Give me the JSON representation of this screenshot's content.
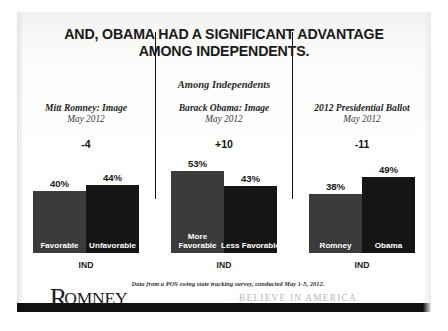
{
  "slide": {
    "title_line1": "AND, OBAMA HAD A SIGNIFICANT ADVANTAGE",
    "title_line2": "AMONG INDEPENDENTS.",
    "subtitle": "Among Independents",
    "source_note": "Data from a POS swing state tracking survey, conducted May 1-5, 2012.",
    "logo_initial": "R",
    "logo_rest": "OMNEY",
    "tagline": "BELIEVE IN AMERICA",
    "accent_color": "#111111",
    "bar_light_color": "#3b3b3b",
    "bar_dark_color": "#151515"
  },
  "chart_data": [
    {
      "type": "bar",
      "title": "Mitt Romney: Image",
      "subtitle": "May 2012",
      "annotation": "-4",
      "categories": [
        "Favorable",
        "Unfavorable"
      ],
      "values": [
        40,
        44
      ],
      "value_labels": [
        "40%",
        "44%"
      ],
      "xlabel": "IND",
      "ylabel": "",
      "ylim": [
        0,
        60
      ],
      "grid": false,
      "legend": "none"
    },
    {
      "type": "bar",
      "title": "Barack Obama: Image",
      "subtitle": "May 2012",
      "annotation": "+10",
      "categories": [
        "More Favorable",
        "Less Favorable"
      ],
      "values": [
        53,
        43
      ],
      "value_labels": [
        "53%",
        "43%"
      ],
      "xlabel": "IND",
      "ylabel": "",
      "ylim": [
        0,
        60
      ],
      "grid": false,
      "legend": "none"
    },
    {
      "type": "bar",
      "title": "2012 Presidential Ballot",
      "subtitle": "May 2012",
      "annotation": "-11",
      "categories": [
        "Romney",
        "Obama"
      ],
      "values": [
        38,
        49
      ],
      "value_labels": [
        "38%",
        "49%"
      ],
      "xlabel": "IND",
      "ylabel": "",
      "ylim": [
        0,
        60
      ],
      "grid": false,
      "legend": "none"
    }
  ]
}
